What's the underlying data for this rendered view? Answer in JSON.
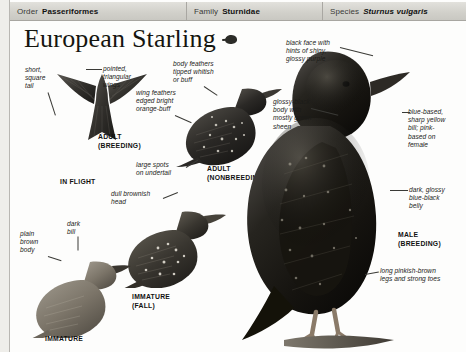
{
  "taxonomy": {
    "order": {
      "label": "Order",
      "value": "Passeriformes"
    },
    "family": {
      "label": "Family",
      "value": "Sturnidae"
    },
    "species": {
      "label": "Species",
      "value": "Sturnus vulgaris"
    }
  },
  "title": "European Starling",
  "annotations": {
    "short_square_tail": "short,\nsquare\ntail",
    "pointed_wings": "pointed,\ntriangular\nwings",
    "body_feathers": "body feathers\ntipped whitish\nor buff",
    "wing_feathers": "wing feathers\nedged bright\norange-buff",
    "large_spots": "large spots\non undertail",
    "dull_head": "dull brownish\nhead",
    "plain_body": "plain\nbrown\nbody",
    "dark_bill": "dark\nbill",
    "black_face": "black face with\nhints of shiny,\nglossy purple",
    "glossy_body": "glossy-black\nbody with\nmostly green\nsheen",
    "bill_detail": "blue-based,\nsharp yellow\nbill; pink-\nbased on\nfemale",
    "belly": "dark, glossy\nblue-black\nbelly",
    "legs": "long pinkish-brown\nlegs and strong toes"
  },
  "plumage_labels": {
    "adult_breeding": "ADULT\n(BREEDING)",
    "in_flight": "IN FLIGHT",
    "adult_nonbreeding": "ADULT\n(NONBREEDING)",
    "immature_fall": "IMMATURE\n(FALL)",
    "immature": "IMMATURE",
    "male_breeding": "MALE\n(BREEDING)"
  },
  "colors": {
    "header_bg": "#d8d7d2",
    "text": "#1b1b18",
    "ink": "#2c2c28"
  }
}
